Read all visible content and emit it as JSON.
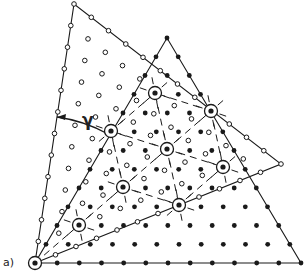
{
  "figure": {
    "panel_label": "a)",
    "angle_symbol": "γ",
    "colors": {
      "ink": "#1a1a1a",
      "background": "#ffffff"
    },
    "origin": [
      35,
      263
    ],
    "divisions": 12,
    "filled_lattice": {
      "name": "filled-circle lattice",
      "vertices": [
        [
          35,
          263
        ],
        [
          301,
          263
        ],
        [
          167,
          38
        ]
      ],
      "dot_radius": 2.4
    },
    "open_lattice": {
      "name": "open-circle lattice",
      "vertices": [
        [
          35,
          263
        ],
        [
          281,
          164
        ],
        [
          74,
          4
        ]
      ],
      "dot_radius": 2.3
    },
    "coincidence_sites": [
      [
        35,
        263
      ],
      [
        79,
        225
      ],
      [
        123,
        187
      ],
      [
        167,
        149
      ],
      [
        211,
        111
      ],
      [
        179,
        205
      ],
      [
        223,
        167
      ],
      [
        111,
        131
      ],
      [
        155,
        93
      ]
    ],
    "csl_links": [
      [
        0,
        1
      ],
      [
        1,
        2
      ],
      [
        2,
        3
      ],
      [
        3,
        4
      ],
      [
        2,
        5
      ],
      [
        3,
        6
      ],
      [
        5,
        6
      ],
      [
        3,
        5
      ],
      [
        4,
        6
      ],
      [
        2,
        7
      ],
      [
        3,
        7
      ],
      [
        7,
        8
      ],
      [
        3,
        8
      ],
      [
        4,
        8
      ]
    ],
    "angle_arc": {
      "center": [
        35,
        263
      ],
      "radius": 148,
      "from_point": [
        57,
        117
      ],
      "to_point": [
        108,
        134
      ]
    },
    "angle_symbol_pos": [
      82,
      110
    ],
    "panel_label_pos": [
      3,
      256
    ]
  }
}
